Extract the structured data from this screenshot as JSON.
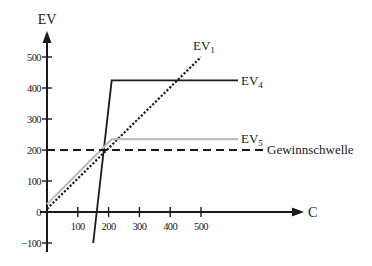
{
  "chart_data": {
    "type": "line",
    "title": "",
    "xlabel": "C",
    "ylabel": "EV",
    "xlim": [
      0,
      530
    ],
    "ylim": [
      -100,
      580
    ],
    "grid": false,
    "legend": "inline labels at line ends",
    "x_ticks": [
      100,
      200,
      300,
      400,
      500
    ],
    "x_tick_labels": [
      "100",
      "200",
      "300",
      "400",
      "500"
    ],
    "y_ticks": [
      -100,
      0,
      100,
      200,
      300,
      400,
      500
    ],
    "y_tick_labels": [
      "−100",
      "0",
      "100",
      "200",
      "300",
      "400",
      "500"
    ],
    "series": [
      {
        "name": "EV1",
        "label_main": "EV",
        "label_sub": "1",
        "style": "dotted",
        "color": "#1a1a1a",
        "x": [
          0,
          500
        ],
        "y": [
          10,
          500
        ]
      },
      {
        "name": "EV4",
        "label_main": "EV",
        "label_sub": "4",
        "style": "solid",
        "color": "#1a1a1a",
        "x": [
          150,
          210,
          620
        ],
        "y": [
          -100,
          425,
          425
        ]
      },
      {
        "name": "EV5",
        "label_main": "EV",
        "label_sub": "5",
        "style": "solid",
        "color": "#bdbdbd",
        "x": [
          0,
          210,
          620
        ],
        "y": [
          25,
          235,
          235
        ]
      },
      {
        "name": "Gewinnschwelle",
        "label_main": "Gewinnschwelle",
        "label_sub": "",
        "style": "dashed",
        "color": "#1a1a1a",
        "x": [
          0,
          708
        ],
        "y": [
          200,
          200
        ]
      }
    ]
  }
}
